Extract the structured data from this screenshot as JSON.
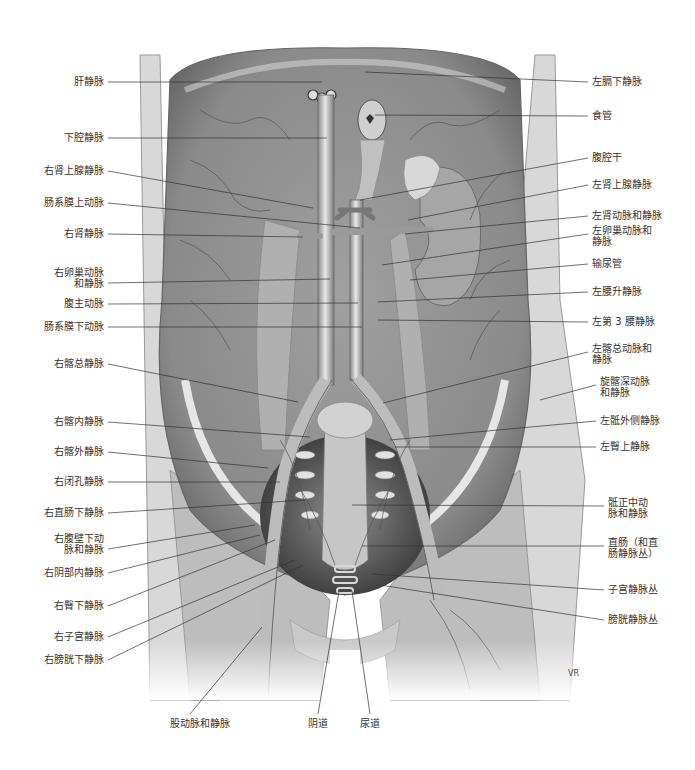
{
  "figure": {
    "signature": "VR"
  },
  "labels_left": [
    {
      "text": "肝静脉",
      "y": 82,
      "tx": 322,
      "ty": 82
    },
    {
      "text": "下腔静脉",
      "y": 138,
      "tx": 327,
      "ty": 138
    },
    {
      "text": "右肾上腺静脉",
      "y": 171,
      "tx": 313,
      "ty": 208
    },
    {
      "text": "肠系膜上动脉",
      "y": 203,
      "tx": 360,
      "ty": 228
    },
    {
      "text": "右肾静脉",
      "y": 234,
      "tx": 303,
      "ty": 237
    },
    {
      "text": "右卵巢动脉\n和静脉",
      "y": 278,
      "tx": 330,
      "ty": 279
    },
    {
      "text": "腹主动脉",
      "y": 304,
      "tx": 358,
      "ty": 303
    },
    {
      "text": "肠系膜下动脉",
      "y": 327,
      "tx": 362,
      "ty": 327
    },
    {
      "text": "右髂总静脉",
      "y": 364,
      "tx": 298,
      "ty": 402
    },
    {
      "text": "右髂内静脉",
      "y": 422,
      "tx": 310,
      "ty": 437
    },
    {
      "text": "右髂外静脉",
      "y": 452,
      "tx": 268,
      "ty": 468
    },
    {
      "text": "右闭孔静脉",
      "y": 482,
      "tx": 280,
      "ty": 482
    },
    {
      "text": "右直肠下静脉",
      "y": 513,
      "tx": 305,
      "ty": 500
    },
    {
      "text": "右腹壁下动\n脉和静脉",
      "y": 544,
      "tx": 255,
      "ty": 525
    },
    {
      "text": "右阴部内静脉",
      "y": 573,
      "tx": 260,
      "ty": 535
    },
    {
      "text": "右臀下静脉",
      "y": 606,
      "tx": 275,
      "ty": 540
    },
    {
      "text": "右子宫静脉",
      "y": 637,
      "tx": 295,
      "ty": 560
    },
    {
      "text": "右膀胱下静脉",
      "y": 660,
      "tx": 303,
      "ty": 565
    }
  ],
  "labels_right": [
    {
      "text": "左膈下静脉",
      "y": 82,
      "tx": 365,
      "ty": 72
    },
    {
      "text": "食管",
      "y": 116,
      "tx": 375,
      "ty": 115
    },
    {
      "text": "腹腔干",
      "y": 158,
      "tx": 360,
      "ty": 200
    },
    {
      "text": "左肾上腺静脉",
      "y": 185,
      "tx": 408,
      "ty": 220
    },
    {
      "text": "左肾动脉和静脉",
      "y": 216,
      "tx": 405,
      "ty": 234
    },
    {
      "text": "左卵巢动脉和\n静脉",
      "y": 236,
      "tx": 382,
      "ty": 265
    },
    {
      "text": "输尿管",
      "y": 264,
      "tx": 410,
      "ty": 280
    },
    {
      "text": "左腰升静脉",
      "y": 292,
      "tx": 378,
      "ty": 302
    },
    {
      "text": "左第 3 腰静脉",
      "y": 322,
      "tx": 378,
      "ty": 320
    },
    {
      "text": "左髂总动脉和\n静脉",
      "y": 354,
      "tx": 383,
      "ty": 403
    },
    {
      "text": "旋髂深动脉\n和静脉",
      "y": 387,
      "tx": 540,
      "ty": 400
    },
    {
      "text": "左骶外侧静脉",
      "y": 421,
      "tx": 390,
      "ty": 440
    },
    {
      "text": "左臀上静脉",
      "y": 447,
      "tx": 395,
      "ty": 447
    },
    {
      "text": "骶正中动\n脉和静脉",
      "y": 508,
      "tx": 352,
      "ty": 505
    },
    {
      "text": "直肠（和直\n肠静脉丛）",
      "y": 548,
      "tx": 362,
      "ty": 546
    },
    {
      "text": "子宫静脉丛",
      "y": 590,
      "tx": 372,
      "ty": 574
    },
    {
      "text": "膀胱静脉丛",
      "y": 620,
      "tx": 380,
      "ty": 585
    }
  ],
  "labels_bottom": [
    {
      "text": "股动脉和静脉",
      "x": 200,
      "y": 724,
      "tx": 262,
      "ty": 627
    },
    {
      "text": "阴道",
      "x": 318,
      "y": 724,
      "tx": 339,
      "ty": 591
    },
    {
      "text": "尿道",
      "x": 370,
      "y": 724,
      "tx": 352,
      "ty": 591
    }
  ]
}
